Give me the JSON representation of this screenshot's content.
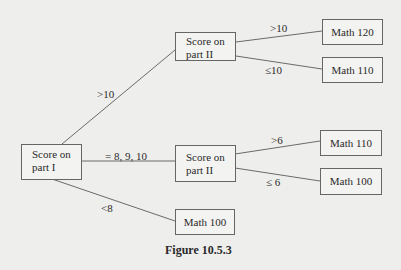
{
  "diagram": {
    "type": "decision-tree",
    "caption": "Figure 10.5.3",
    "nodes": {
      "root": {
        "line1": "Score on",
        "line2": "part I"
      },
      "top_mid": {
        "line1": "Score on",
        "line2": "part II"
      },
      "mid_mid": {
        "line1": "Score on",
        "line2": "part II"
      },
      "bottom": {
        "label": "Math 100"
      },
      "leaf_tt": {
        "label": "Math 120"
      },
      "leaf_tb": {
        "label": "Math 110"
      },
      "leaf_mt": {
        "label": "Math 110"
      },
      "leaf_mb": {
        "label": "Math 100"
      }
    },
    "edges": {
      "root_top": ">10",
      "root_mid": "= 8, 9, 10",
      "root_bottom": "<8",
      "top_upper": ">10",
      "top_lower": "≤10",
      "mid_upper": ">6",
      "mid_lower": "≤ 6"
    }
  }
}
